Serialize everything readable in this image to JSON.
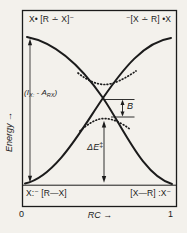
{
  "figure": {
    "bg": "#f3f1ec",
    "ink": "#1b1b1b"
  },
  "axes": {
    "y_label": "Energy →",
    "x_label": "RC →",
    "tick_left": "0",
    "tick_right": "1"
  },
  "states": {
    "top_left": "X• [R ∸ X]⁻",
    "top_right": "⁻[X ∸ R] •X",
    "bottom_left": "X:⁻ [R—X]",
    "bottom_right": "[X—R] :X⁻"
  },
  "annotations": {
    "gap": {
      "open": "(",
      "i": "I",
      "i_sub": "X:",
      "minus": " - ",
      "a": "A",
      "a_sub": "RX",
      "close": ")"
    },
    "resonance": "B",
    "activation_base": "ΔE",
    "activation_sup": "‡"
  }
}
